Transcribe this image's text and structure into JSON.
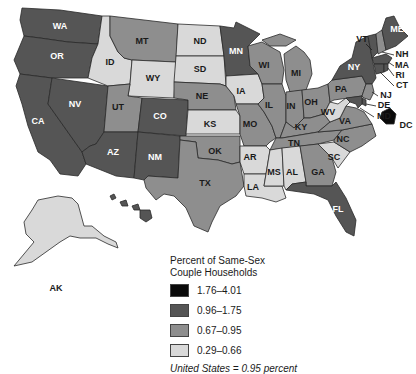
{
  "legend": {
    "title_line1": "Percent of Same-Sex",
    "title_line2": "Couple Households",
    "classes": [
      {
        "label": "1.76–4.01",
        "color": "#0a0a0a"
      },
      {
        "label": "0.96–1.75",
        "color": "#555555"
      },
      {
        "label": "0.67–0.95",
        "color": "#8e8e8e"
      },
      {
        "label": "0.29–0.66",
        "color": "#d9d9d9"
      }
    ],
    "note": "United States = 0.95 percent"
  },
  "states": {
    "WA": {
      "label": "WA",
      "class": 1
    },
    "OR": {
      "label": "OR",
      "class": 1
    },
    "CA": {
      "label": "CA",
      "class": 1
    },
    "NV": {
      "label": "NV",
      "class": 1
    },
    "ID": {
      "label": "ID",
      "class": 3
    },
    "MT": {
      "label": "MT",
      "class": 2
    },
    "WY": {
      "label": "WY",
      "class": 3
    },
    "UT": {
      "label": "UT",
      "class": 2
    },
    "AZ": {
      "label": "AZ",
      "class": 1
    },
    "CO": {
      "label": "CO",
      "class": 1
    },
    "NM": {
      "label": "NM",
      "class": 1
    },
    "ND": {
      "label": "ND",
      "class": 3
    },
    "SD": {
      "label": "SD",
      "class": 3
    },
    "NE": {
      "label": "NE",
      "class": 2
    },
    "KS": {
      "label": "KS",
      "class": 3
    },
    "OK": {
      "label": "OK",
      "class": 2
    },
    "TX": {
      "label": "TX",
      "class": 2
    },
    "MN": {
      "label": "MN",
      "class": 1
    },
    "IA": {
      "label": "IA",
      "class": 3
    },
    "MO": {
      "label": "MO",
      "class": 2
    },
    "AR": {
      "label": "AR",
      "class": 3
    },
    "LA": {
      "label": "LA",
      "class": 3
    },
    "WI": {
      "label": "WI",
      "class": 2
    },
    "IL": {
      "label": "IL",
      "class": 2
    },
    "MI": {
      "label": "MI",
      "class": 2
    },
    "IN": {
      "label": "IN",
      "class": 2
    },
    "OH": {
      "label": "OH",
      "class": 2
    },
    "KY": {
      "label": "KY",
      "class": 2
    },
    "TN": {
      "label": "TN",
      "class": 2
    },
    "MS": {
      "label": "MS",
      "class": 3
    },
    "AL": {
      "label": "AL",
      "class": 3
    },
    "GA": {
      "label": "GA",
      "class": 2
    },
    "FL": {
      "label": "FL",
      "class": 1
    },
    "SC": {
      "label": "SC",
      "class": 3
    },
    "NC": {
      "label": "NC",
      "class": 2
    },
    "VA": {
      "label": "VA",
      "class": 2
    },
    "WV": {
      "label": "WV",
      "class": 3
    },
    "PA": {
      "label": "PA",
      "class": 2
    },
    "NY": {
      "label": "NY",
      "class": 1
    },
    "VT": {
      "label": "VT",
      "class": 1
    },
    "NH": {
      "label": "NH",
      "class": 2
    },
    "ME": {
      "label": "ME",
      "class": 1
    },
    "MA": {
      "label": "MA",
      "class": 1
    },
    "RI": {
      "label": "RI",
      "class": 1
    },
    "CT": {
      "label": "CT",
      "class": 1
    },
    "NJ": {
      "label": "NJ",
      "class": 2
    },
    "DE": {
      "label": "DE",
      "class": 1
    },
    "MD": {
      "label": "MD",
      "class": 1
    },
    "DC": {
      "label": "DC",
      "class": 0
    },
    "AK": {
      "label": "AK",
      "class": 3
    },
    "HI": {
      "label": "HI",
      "class": 1
    }
  }
}
